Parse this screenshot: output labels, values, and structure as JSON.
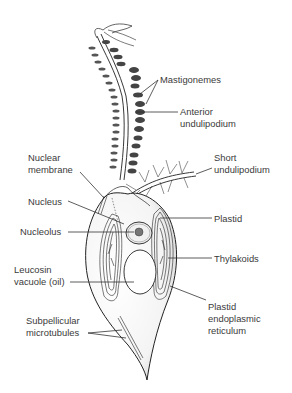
{
  "diagram": {
    "background": "#ffffff",
    "ink_color": "#222222",
    "labels": [
      {
        "id": "mastigonemes",
        "lines": [
          "Mastigonemes"
        ],
        "side": "right"
      },
      {
        "id": "anterior-undulipodium",
        "lines": [
          "Anterior",
          "undulipodium"
        ],
        "side": "right"
      },
      {
        "id": "short-undulipodium",
        "lines": [
          "Short",
          "undulipodium"
        ],
        "side": "right"
      },
      {
        "id": "nuclear-membrane",
        "lines": [
          "Nuclear",
          "membrane"
        ],
        "side": "left"
      },
      {
        "id": "nucleus",
        "lines": [
          "Nucleus"
        ],
        "side": "left"
      },
      {
        "id": "plastid",
        "lines": [
          "Plastid"
        ],
        "side": "right"
      },
      {
        "id": "nucleolus",
        "lines": [
          "Nucleolus"
        ],
        "side": "left"
      },
      {
        "id": "thylakoids",
        "lines": [
          "Thylakoids"
        ],
        "side": "right"
      },
      {
        "id": "leucosin-vacuole",
        "lines": [
          "Leucosin",
          "vacuole (oil)"
        ],
        "side": "left"
      },
      {
        "id": "plastid-er",
        "lines": [
          "Plastid",
          "endoplasmic",
          "reticulum"
        ],
        "side": "right"
      },
      {
        "id": "subpellicular-microtubules",
        "lines": [
          "Subpellicular",
          "microtubules"
        ],
        "side": "left"
      }
    ]
  }
}
